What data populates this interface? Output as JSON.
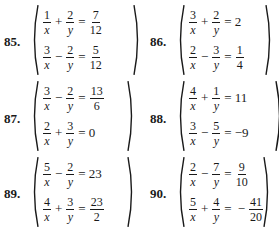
{
  "problems": [
    {
      "number": "85.",
      "equations": [
        {
          "t1": {
            "num": "1",
            "den": "x"
          },
          "op": "+",
          "t2": {
            "num": "2",
            "den": "y"
          },
          "eq": "=",
          "rhs_sign": "",
          "rhs_frac": {
            "num": "7",
            "den": "12"
          },
          "rhs_plain": ""
        },
        {
          "t1": {
            "num": "3",
            "den": "x"
          },
          "op": "−",
          "t2": {
            "num": "2",
            "den": "y"
          },
          "eq": "=",
          "rhs_sign": "",
          "rhs_frac": {
            "num": "5",
            "den": "12"
          },
          "rhs_plain": ""
        }
      ]
    },
    {
      "number": "86.",
      "equations": [
        {
          "t1": {
            "num": "3",
            "den": "x"
          },
          "op": "+",
          "t2": {
            "num": "2",
            "den": "y"
          },
          "eq": "=",
          "rhs_sign": "",
          "rhs_frac": null,
          "rhs_plain": "2"
        },
        {
          "t1": {
            "num": "2",
            "den": "x"
          },
          "op": "−",
          "t2": {
            "num": "3",
            "den": "y"
          },
          "eq": "=",
          "rhs_sign": "",
          "rhs_frac": {
            "num": "1",
            "den": "4"
          },
          "rhs_plain": ""
        }
      ]
    },
    {
      "number": "87.",
      "equations": [
        {
          "t1": {
            "num": "3",
            "den": "x"
          },
          "op": "−",
          "t2": {
            "num": "2",
            "den": "y"
          },
          "eq": "=",
          "rhs_sign": "",
          "rhs_frac": {
            "num": "13",
            "den": "6"
          },
          "rhs_plain": ""
        },
        {
          "t1": {
            "num": "2",
            "den": "x"
          },
          "op": "+",
          "t2": {
            "num": "3",
            "den": "y"
          },
          "eq": "=",
          "rhs_sign": "",
          "rhs_frac": null,
          "rhs_plain": "0"
        }
      ]
    },
    {
      "number": "88.",
      "equations": [
        {
          "t1": {
            "num": "4",
            "den": "x"
          },
          "op": "+",
          "t2": {
            "num": "1",
            "den": "y"
          },
          "eq": "=",
          "rhs_sign": "",
          "rhs_frac": null,
          "rhs_plain": "11"
        },
        {
          "t1": {
            "num": "3",
            "den": "x"
          },
          "op": "−",
          "t2": {
            "num": "5",
            "den": "y"
          },
          "eq": "=",
          "rhs_sign": "",
          "rhs_frac": null,
          "rhs_plain": "−9"
        }
      ]
    },
    {
      "number": "89.",
      "equations": [
        {
          "t1": {
            "num": "5",
            "den": "x"
          },
          "op": "−",
          "t2": {
            "num": "2",
            "den": "y"
          },
          "eq": "=",
          "rhs_sign": "",
          "rhs_frac": null,
          "rhs_plain": "23"
        },
        {
          "t1": {
            "num": "4",
            "den": "x"
          },
          "op": "+",
          "t2": {
            "num": "3",
            "den": "y"
          },
          "eq": "=",
          "rhs_sign": "",
          "rhs_frac": {
            "num": "23",
            "den": "2"
          },
          "rhs_plain": ""
        }
      ]
    },
    {
      "number": "90.",
      "equations": [
        {
          "t1": {
            "num": "2",
            "den": "x"
          },
          "op": "−",
          "t2": {
            "num": "7",
            "den": "y"
          },
          "eq": "=",
          "rhs_sign": "",
          "rhs_frac": {
            "num": "9",
            "den": "10"
          },
          "rhs_plain": ""
        },
        {
          "t1": {
            "num": "5",
            "den": "x"
          },
          "op": "+",
          "t2": {
            "num": "4",
            "den": "y"
          },
          "eq": "=",
          "rhs_sign": "−",
          "rhs_frac": {
            "num": "41",
            "den": "20"
          },
          "rhs_plain": ""
        }
      ]
    }
  ]
}
